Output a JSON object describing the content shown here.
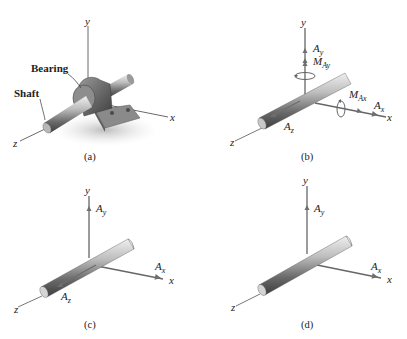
{
  "figure": {
    "panels": [
      {
        "id": "a",
        "caption": "(a)",
        "axes": {
          "x": "x",
          "y": "y",
          "z": "z"
        },
        "callouts": [
          "Bearing",
          "Shaft"
        ]
      },
      {
        "id": "b",
        "caption": "(b)",
        "axes": {
          "x": "x",
          "y": "y",
          "z": "z"
        },
        "reactions": {
          "Ay": {
            "main": "A",
            "sub": "y"
          },
          "MAy": {
            "main": "M",
            "sub": "Ay"
          },
          "MAx": {
            "main": "M",
            "sub": "Ax"
          },
          "Ax": {
            "main": "A",
            "sub": "x"
          },
          "Az": {
            "main": "A",
            "sub": "z"
          }
        }
      },
      {
        "id": "c",
        "caption": "(c)",
        "axes": {
          "x": "x",
          "y": "y",
          "z": "z"
        },
        "reactions": {
          "Ay": {
            "main": "A",
            "sub": "y"
          },
          "Ax": {
            "main": "A",
            "sub": "x"
          },
          "Az": {
            "main": "A",
            "sub": "z"
          }
        }
      },
      {
        "id": "d",
        "caption": "(d)",
        "axes": {
          "x": "x",
          "y": "y",
          "z": "z"
        },
        "reactions": {
          "Ay": {
            "main": "A",
            "sub": "y"
          },
          "Ax": {
            "main": "A",
            "sub": "x"
          }
        }
      }
    ],
    "colors": {
      "axis": "#555555",
      "force": "#6e6e6e",
      "shaft_dark": "#5a5a5a",
      "shaft_light": "#d9d9d9",
      "bearing": "#7a7a7a",
      "text": "#222222"
    }
  }
}
